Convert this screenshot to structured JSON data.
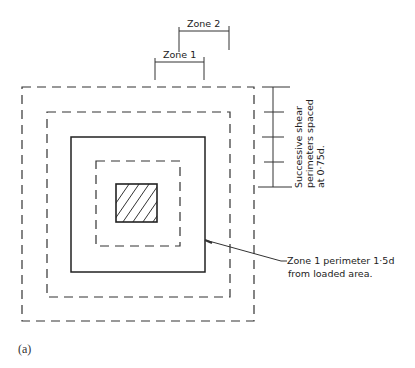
{
  "figure": {
    "caption": "(a)",
    "colors": {
      "line": "#2a2a2a",
      "background": "#ffffff"
    }
  },
  "dimensions": {
    "zone1_label": "Zone 1",
    "zone2_label": "Zone 2",
    "spacing_line1": "Successive  shear",
    "spacing_line2": "perimeters  spaced",
    "spacing_line3": "at  0·75d."
  },
  "callout": {
    "line1": "Zone 1  perimeter  1·5d",
    "line2": "from  loaded  area."
  },
  "perimeters": [
    {
      "name": "outer-dashed",
      "style": "dashed"
    },
    {
      "name": "second-dashed",
      "style": "dashed"
    },
    {
      "name": "zone1-perimeter",
      "style": "solid"
    },
    {
      "name": "inner-dashed",
      "style": "dashed"
    },
    {
      "name": "loaded-area",
      "style": "hatched"
    }
  ]
}
